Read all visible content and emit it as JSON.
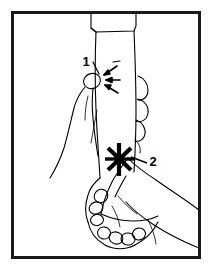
{
  "figure": {
    "kind": "line-art-illustration",
    "background_color": "#ffffff",
    "ink_color": "#000000",
    "frame": {
      "name": "border-frame",
      "x": 11,
      "y": 11,
      "width": 190,
      "height": 248,
      "stroke_width": 3,
      "color": "#1a1a1a"
    },
    "annotations": [
      {
        "id": "1",
        "label": "1",
        "marker": "converging-arrows",
        "label_x": 86,
        "label_y": 66,
        "target_x": 99,
        "target_y": 79,
        "description": "pressure point on thumb / radial side"
      },
      {
        "id": "2",
        "label": "2",
        "marker": "starburst",
        "label_x": 153,
        "label_y": 166,
        "target_x": 120,
        "target_y": 159,
        "description": "pressure point on wrist / ulnar side"
      }
    ]
  }
}
